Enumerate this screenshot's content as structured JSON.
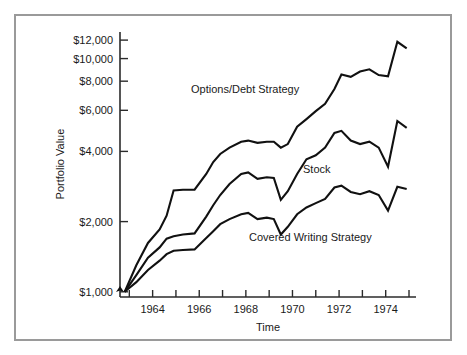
{
  "chart_data": {
    "type": "line",
    "title": "",
    "xlabel": "Time",
    "ylabel": "Portfolio Value",
    "yscale": "log",
    "ylim": [
      950,
      13000
    ],
    "xlim": [
      1962.6,
      1975.3
    ],
    "grid": false,
    "legend_position": "inline-annotations",
    "y_tick_values": [
      1000,
      2000,
      4000,
      6000,
      8000,
      10000,
      12000
    ],
    "y_tick_labels": [
      "$1,000",
      "$2,000",
      "$4,000",
      "$6,000",
      "$8,000",
      "$10,000",
      "$12,000"
    ],
    "x_tick_values": [
      1963,
      1964,
      1965,
      1966,
      1967,
      1968,
      1969,
      1970,
      1971,
      1972,
      1973,
      1974,
      1975
    ],
    "x_tick_labels": [
      "",
      "1964",
      "",
      "1966",
      "",
      "1968",
      "",
      "1970",
      "",
      "1972",
      "",
      "1974",
      ""
    ],
    "x_labeled_ticks": [
      "1964",
      "1966",
      "1968",
      "1970",
      "1972",
      "1974"
    ],
    "x": [
      1962.8,
      1963.3,
      1963.8,
      1964.3,
      1964.6,
      1964.9,
      1965.3,
      1965.8,
      1966.3,
      1966.6,
      1966.9,
      1967.3,
      1967.8,
      1968.1,
      1968.5,
      1968.9,
      1969.2,
      1969.5,
      1969.8,
      1970.2,
      1970.6,
      1971.0,
      1971.4,
      1971.8,
      1972.1,
      1972.5,
      1972.9,
      1973.3,
      1973.7,
      1974.1,
      1974.5,
      1974.9
    ],
    "series": [
      {
        "name": "Options/Debt Strategy",
        "label_text": "Options/Debt Strategy",
        "values": [
          1000,
          1300,
          1620,
          1850,
          2120,
          2720,
          2740,
          2740,
          3200,
          3600,
          3900,
          4150,
          4400,
          4450,
          4350,
          4400,
          4400,
          4150,
          4300,
          5100,
          5500,
          5950,
          6400,
          7400,
          8550,
          8350,
          8800,
          9000,
          8500,
          8400,
          11800,
          11050
        ]
      },
      {
        "name": "Stock",
        "label_text": "Stock",
        "values": [
          1000,
          1180,
          1400,
          1550,
          1690,
          1730,
          1760,
          1780,
          2100,
          2350,
          2600,
          2900,
          3200,
          3250,
          3050,
          3100,
          3080,
          2480,
          2700,
          3200,
          3700,
          3850,
          4150,
          4800,
          4900,
          4450,
          4300,
          4400,
          4150,
          3440,
          5400,
          5050
        ]
      },
      {
        "name": "Covered Writing Strategy",
        "label_text": "Covered Writing Strategy",
        "values": [
          1000,
          1100,
          1240,
          1360,
          1450,
          1500,
          1510,
          1520,
          1700,
          1820,
          1950,
          2050,
          2150,
          2180,
          2050,
          2080,
          2050,
          1760,
          1900,
          2150,
          2300,
          2400,
          2500,
          2800,
          2850,
          2680,
          2620,
          2700,
          2600,
          2230,
          2820,
          2760
        ]
      }
    ]
  },
  "annotations": {
    "options_debt": "Options/Debt Strategy",
    "stock": "Stock",
    "covered_writing": "Covered Writing Strategy"
  },
  "axes": {
    "y_title": "Portfolio Value",
    "x_title": "Time",
    "y_labels": [
      "$12,000",
      "$10,000",
      "$8,000",
      "$6,000",
      "$4,000",
      "$2,000",
      "$1,000"
    ],
    "x_labels": [
      "1964",
      "1966",
      "1968",
      "1970",
      "1972",
      "1974"
    ]
  },
  "colors": {
    "line": "#111111",
    "axis": "#2b2b2b",
    "frame": "#9a9a9a",
    "background": "#ffffff",
    "text": "#1a1a1a"
  }
}
